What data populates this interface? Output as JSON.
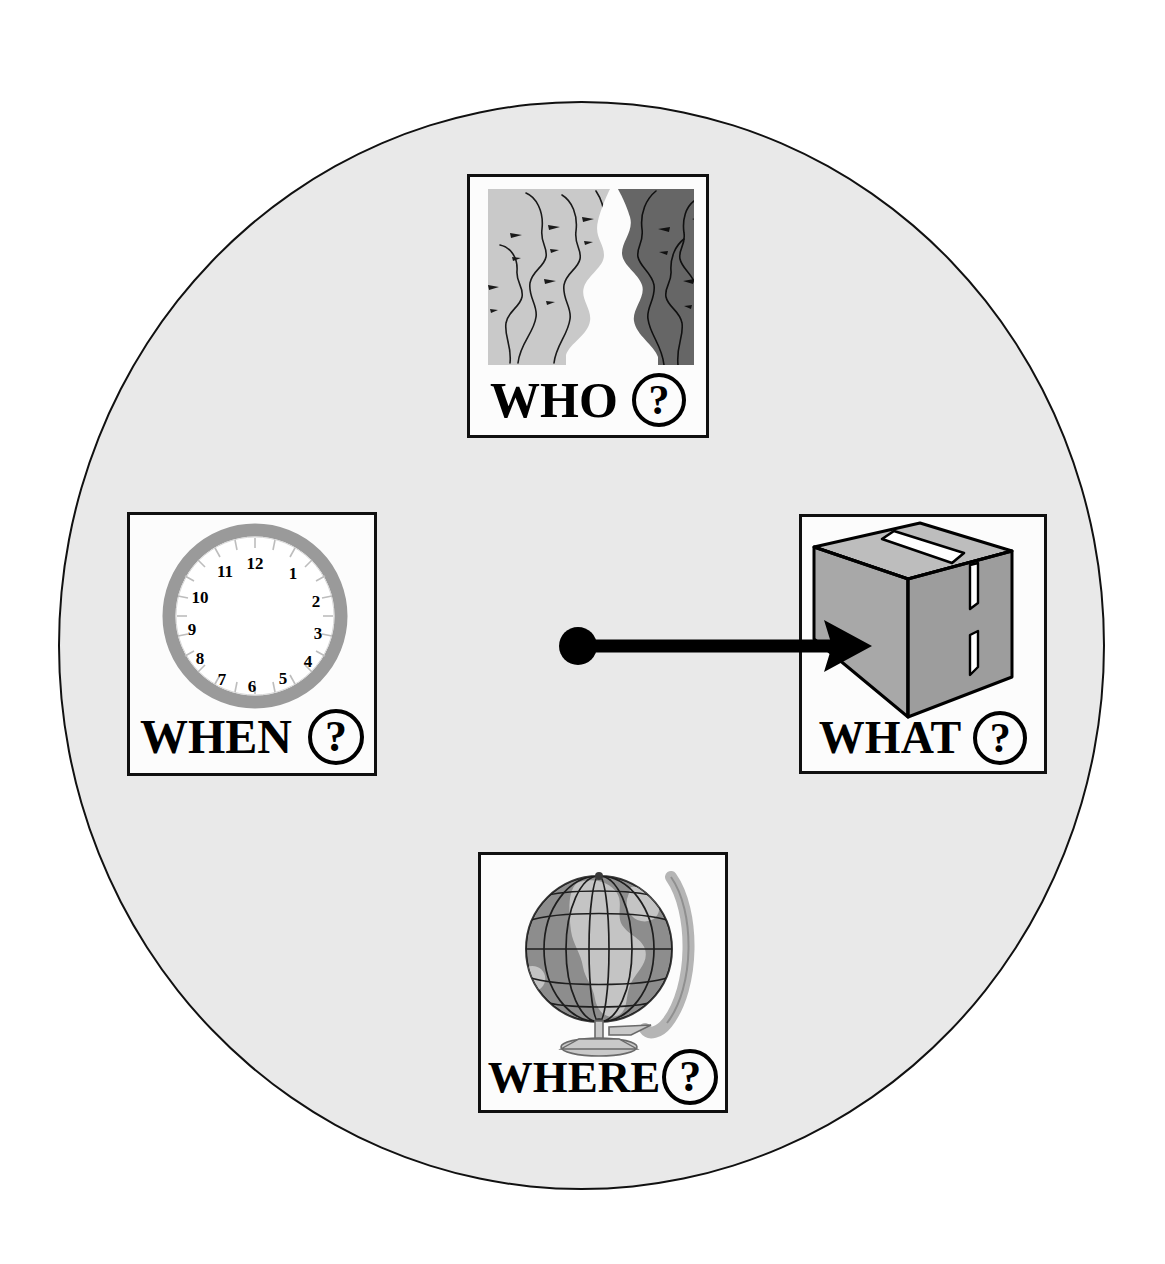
{
  "diagram": {
    "background_color": "#ffffff",
    "circle": {
      "name": "context-circle",
      "fill": "#e9e9e9",
      "stroke": "#111111",
      "center_x": 581,
      "center_y": 646,
      "radius_x": 523,
      "radius_y": 544
    },
    "focus_marker": {
      "name": "focus-dot",
      "color": "#000000",
      "x": 578,
      "y": 646,
      "radius": 18
    },
    "arrow": {
      "name": "pointer-arrow",
      "color": "#000000",
      "from_x": 578,
      "from_y": 646,
      "to_x": 866,
      "to_y": 646,
      "thickness": 13,
      "points_to": "WHAT"
    }
  },
  "panels": [
    {
      "id": "who",
      "label": "WHO",
      "question_mark": "?",
      "icon": "two-groups-of-face-profiles-icon",
      "description": "Light gray block of face profiles facing right and dark gray block of face profiles facing left",
      "colors": {
        "left_block": "#c9c9c9",
        "right_block": "#666666",
        "gap": "#ffffff"
      },
      "position": {
        "left": 467,
        "top": 174,
        "width": 242,
        "height": 264
      }
    },
    {
      "id": "when",
      "label": "WHEN",
      "question_mark": "?",
      "icon": "clock-face-icon",
      "description": "Handless clock face with gray rim and hour numbers 12 to 11",
      "hour_numbers": [
        "12",
        "1",
        "2",
        "3",
        "4",
        "5",
        "6",
        "7",
        "8",
        "9",
        "10",
        "11"
      ],
      "colors": {
        "rim": "#9a9a9a",
        "dial": "#ffffff",
        "numerals": "#000000"
      },
      "position": {
        "left": 127,
        "top": 512,
        "width": 250,
        "height": 264
      }
    },
    {
      "id": "what",
      "label": "WHAT",
      "question_mark": "?",
      "icon": "cardboard-box-icon",
      "description": "Gray three dimensional sealed cardboard carton seen from above left",
      "colors": {
        "box_face": "#a8a8a8",
        "box_top": "#bdbdbd",
        "outline": "#000000"
      },
      "position": {
        "left": 799,
        "top": 514,
        "width": 248,
        "height": 260
      }
    },
    {
      "id": "where",
      "label": "WHERE",
      "question_mark": "?",
      "icon": "desk-globe-icon",
      "description": "Gray desk globe with meridian ring and pedestal base, graticule lines and continents",
      "colors": {
        "ocean": "#8d8d8d",
        "land": "#c4c4c4",
        "ring": "#b5b5b5",
        "stand": "#c9c9c9"
      },
      "position": {
        "left": 478,
        "top": 852,
        "width": 250,
        "height": 261
      }
    }
  ]
}
